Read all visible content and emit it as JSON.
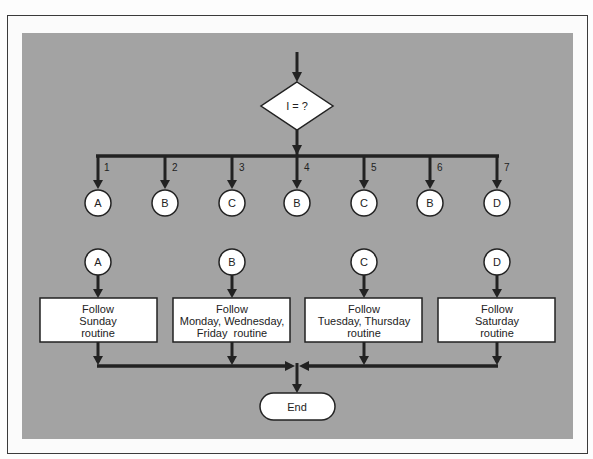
{
  "diagram": {
    "colors": {
      "panel": "#a3a3a3",
      "frame": "#3a3a3a",
      "node_fill": "#ffffff",
      "line": "#222222"
    },
    "decision": {
      "label": "I = ?"
    },
    "branches": [
      {
        "number": "1",
        "connector": "A"
      },
      {
        "number": "2",
        "connector": "B"
      },
      {
        "number": "3",
        "connector": "C"
      },
      {
        "number": "4",
        "connector": "B"
      },
      {
        "number": "5",
        "connector": "C"
      },
      {
        "number": "6",
        "connector": "B"
      },
      {
        "number": "7",
        "connector": "D"
      }
    ],
    "routines": [
      {
        "connector": "A",
        "lines": [
          "Follow",
          "Sunday",
          "routine"
        ]
      },
      {
        "connector": "B",
        "lines": [
          "Follow",
          "Monday, Wednesday,",
          "Friday  routine"
        ]
      },
      {
        "connector": "C",
        "lines": [
          "Follow",
          "Tuesday, Thursday",
          "routine"
        ]
      },
      {
        "connector": "D",
        "lines": [
          "Follow",
          "Saturday",
          "routine"
        ]
      }
    ],
    "terminal": {
      "label": "End"
    }
  }
}
